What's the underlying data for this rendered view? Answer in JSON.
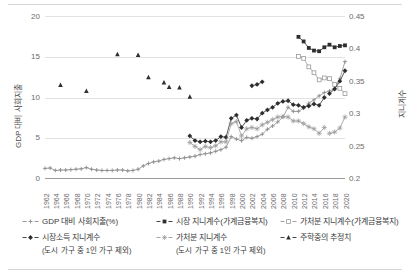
{
  "chart_data": {
    "type": "line",
    "title": "",
    "xlabel": "",
    "ylabel": "GDP 대비 사회지출",
    "ylabel_secondary": "지니계수",
    "ylim": [
      0,
      20
    ],
    "ylim_secondary": [
      0.2,
      0.45
    ],
    "yticks": [
      "0",
      "5",
      "10",
      "15",
      "20"
    ],
    "yticks_secondary": [
      "0.2",
      "0.25",
      "0.3",
      "0.35",
      "0.4",
      "0.45"
    ],
    "xlim": [
      1962,
      2020
    ],
    "xticks": [
      "1962",
      "1964",
      "1966",
      "1968",
      "1970",
      "1972",
      "1974",
      "1976",
      "1978",
      "1980",
      "1982",
      "1984",
      "1986",
      "1988",
      "1990",
      "1992",
      "1994",
      "1996",
      "1998",
      "2000",
      "2002",
      "2004",
      "2006",
      "2008",
      "2010",
      "2012",
      "2014",
      "2016",
      "2018",
      "2020"
    ],
    "grid": true,
    "legend_position": "bottom",
    "series": [
      {
        "name": "GDP 대비 사회지출(%)",
        "axis": "left",
        "marker": "plus",
        "color": "#8c8c8c",
        "x": [
          1962,
          1963,
          1964,
          1965,
          1966,
          1967,
          1968,
          1969,
          1970,
          1971,
          1972,
          1973,
          1974,
          1975,
          1976,
          1977,
          1978,
          1979,
          1980,
          1981,
          1982,
          1983,
          1984,
          1985,
          1986,
          1987,
          1988,
          1989,
          1990,
          1991,
          1992,
          1993,
          1994,
          1995,
          1996,
          1997,
          1998,
          1999,
          2000,
          2001,
          2002,
          2003,
          2004,
          2005,
          2006,
          2007,
          2008,
          2009,
          2010,
          2011,
          2012,
          2013,
          2014,
          2015,
          2016,
          2017,
          2018,
          2019,
          2020
        ],
        "y": [
          1.3,
          1.35,
          1.05,
          1.1,
          1.1,
          1.15,
          1.2,
          1.25,
          1.4,
          1.2,
          1.1,
          1.05,
          1.05,
          1.05,
          1.1,
          1.1,
          1.0,
          1.05,
          1.2,
          1.6,
          1.9,
          2.1,
          2.2,
          2.4,
          2.5,
          2.6,
          2.5,
          2.6,
          2.7,
          2.8,
          3.0,
          3.1,
          3.2,
          3.4,
          3.6,
          3.9,
          5.2,
          4.9,
          4.7,
          5.1,
          5.0,
          5.2,
          5.5,
          6.1,
          6.5,
          7.0,
          7.6,
          8.8,
          8.3,
          8.3,
          8.7,
          9.3,
          9.7,
          10.2,
          10.6,
          10.8,
          11.1,
          12.3,
          14.4
        ]
      },
      {
        "name": "시장 지니계수(가계금융복지)",
        "axis": "right",
        "marker": "filled-square",
        "color": "#2e2e2e",
        "x": [
          2011,
          2012,
          2013,
          2014,
          2015,
          2016,
          2017,
          2018,
          2019,
          2020
        ],
        "y": [
          0.418,
          0.411,
          0.401,
          0.397,
          0.396,
          0.402,
          0.406,
          0.402,
          0.404,
          0.405
        ]
      },
      {
        "name": "가처분 지니계수(가계금융복지)",
        "axis": "right",
        "marker": "open-square",
        "color": "#9a9a9a",
        "x": [
          2011,
          2012,
          2013,
          2014,
          2015,
          2016,
          2017,
          2018,
          2019,
          2020
        ],
        "y": [
          0.388,
          0.385,
          0.372,
          0.363,
          0.352,
          0.355,
          0.354,
          0.345,
          0.339,
          0.331
        ]
      },
      {
        "name": "시장소득 지니계수",
        "name_sub": "(도시 가구 중 1인 가구 제외)",
        "axis": "right",
        "marker": "filled-diamond",
        "color": "#2e2e2e",
        "x": [
          1990,
          1991,
          1992,
          1993,
          1994,
          1995,
          1996,
          1997,
          1998,
          1999,
          2000,
          2001,
          2002,
          2003,
          2004,
          2005,
          2006,
          2007,
          2008,
          2009,
          2010,
          2011,
          2012,
          2013,
          2014,
          2015,
          2016
        ],
        "y": [
          0.266,
          0.259,
          0.257,
          0.258,
          0.257,
          0.259,
          0.265,
          0.264,
          0.293,
          0.298,
          0.279,
          0.29,
          0.293,
          0.292,
          0.301,
          0.306,
          0.31,
          0.316,
          0.319,
          0.32,
          0.314,
          0.313,
          0.31,
          0.312,
          0.315,
          0.313,
          0.325
        ]
      },
      {
        "name": "가처분 지니계수",
        "name_sub": "(도시 가구 중 1인 가구 제외)",
        "axis": "right",
        "marker": "star",
        "color": "#9a9a9a",
        "x": [
          1990,
          1991,
          1992,
          1993,
          1994,
          1995,
          1996,
          1997,
          1998,
          1999,
          2000,
          2001,
          2002,
          2003,
          2004,
          2005,
          2006,
          2007,
          2008,
          2009,
          2010,
          2011,
          2012,
          2013,
          2014,
          2015,
          2016
        ],
        "y": [
          0.256,
          0.25,
          0.245,
          0.25,
          0.248,
          0.251,
          0.257,
          0.257,
          0.285,
          0.288,
          0.266,
          0.277,
          0.279,
          0.277,
          0.283,
          0.287,
          0.291,
          0.295,
          0.296,
          0.295,
          0.289,
          0.289,
          0.285,
          0.28,
          0.277,
          0.27,
          0.279
        ]
      },
      {
        "name": "주학중의 추정치",
        "axis": "right",
        "marker": "filled-triangle",
        "color": "#2e2e2e",
        "x": [
          1965,
          1970,
          1976,
          1980,
          1982,
          1985,
          1986,
          1988,
          1990
        ],
        "y": [
          0.344,
          0.335,
          0.391,
          0.39,
          0.356,
          0.348,
          0.341,
          0.34,
          0.326
        ]
      }
    ],
    "extra_segments": [
      {
        "name": "가처분 지니계수 (도시 가구) 후반 구간",
        "axis": "right",
        "marker": "star",
        "color": "#9a9a9a",
        "x": [
          2017,
          2018,
          2019,
          2020
        ],
        "y": [
          0.27,
          0.272,
          0.278,
          0.295
        ]
      },
      {
        "name": "시장소득 지니계수 후반 구간",
        "axis": "right",
        "marker": "filled-diamond",
        "color": "#2e2e2e",
        "x": [
          2017,
          2018,
          2019,
          2020
        ],
        "y": [
          0.331,
          0.338,
          0.35,
          0.366
        ]
      },
      {
        "name": "주학중의 추정치 후반 구간",
        "axis": "right",
        "marker": "filled-diamond",
        "color": "#2e2e2e",
        "x": [
          2002,
          2003,
          2004
        ],
        "y": [
          0.343,
          0.345,
          0.349
        ]
      }
    ]
  },
  "axes": {
    "left_title": "GDP 대비 사회지출",
    "right_title": "지니계수"
  },
  "legend": {
    "items": [
      {
        "label": "GDP 대비 사회지출(%)",
        "sub": "",
        "marker": "plus",
        "color": "#8c8c8c"
      },
      {
        "label": "시장 지니계수(가계금융복지)",
        "sub": "",
        "marker": "filled-square",
        "color": "#2e2e2e"
      },
      {
        "label": "가처분 지니계수(가계금융복지)",
        "sub": "",
        "marker": "open-square",
        "color": "#9a9a9a"
      },
      {
        "label": "시장소득 지니계수",
        "sub": "(도시 가구 중 1인 가구 제외)",
        "marker": "filled-diamond",
        "color": "#2e2e2e"
      },
      {
        "label": "가처분 지니계수",
        "sub": "(도시 가구 중 1인 가구 제외)",
        "marker": "star",
        "color": "#9a9a9a"
      },
      {
        "label": "주학중의 추정치",
        "sub": "",
        "marker": "filled-triangle",
        "color": "#2e2e2e"
      }
    ]
  }
}
